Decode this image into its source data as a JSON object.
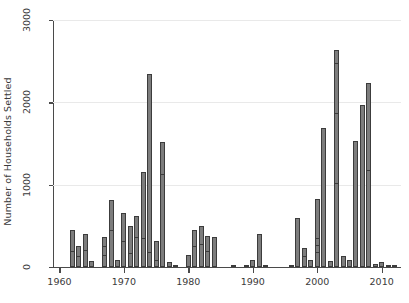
{
  "chart_data": {
    "type": "bar",
    "title": "",
    "subtitle": "",
    "xlabel": "",
    "ylabel": "Number of Households Settled",
    "xlim": [
      1959,
      2013
    ],
    "ylim": [
      0,
      3000
    ],
    "grid": "horizontal gridlines at 1000, 2000, 3000",
    "legend": "none",
    "x_ticks": [
      1960,
      1970,
      1980,
      1990,
      2000,
      2010
    ],
    "y_ticks": [
      0,
      1000,
      2000,
      3000
    ],
    "bar_color": "#7d7d7d",
    "bar_edge_color": "#3c3c3c",
    "gridline_color": "#e9e9e9",
    "axis_color": "#4a4a4a",
    "note": "Bars are internally segmented by thin horizontal rules (stacked sub-groups).",
    "categories": [
      1962,
      1963,
      1964,
      1965,
      1967,
      1968,
      1969,
      1970,
      1971,
      1972,
      1973,
      1974,
      1975,
      1976,
      1977,
      1978,
      1980,
      1981,
      1982,
      1983,
      1984,
      1987,
      1989,
      1990,
      1991,
      1992,
      1996,
      1997,
      1998,
      1999,
      2000,
      2001,
      2002,
      2003,
      2004,
      2005,
      2006,
      2007,
      2008,
      2009,
      2010,
      2011,
      2012
    ],
    "values": [
      450,
      250,
      400,
      70,
      360,
      820,
      80,
      650,
      500,
      620,
      1160,
      2350,
      320,
      1520,
      60,
      30,
      150,
      450,
      500,
      380,
      360,
      30,
      10,
      90,
      400,
      20,
      30,
      600,
      230,
      80,
      830,
      1690,
      70,
      2640,
      130,
      90,
      1530,
      1970,
      2230,
      40,
      55,
      25,
      15
    ],
    "series": [
      {
        "name": "Households settled per year",
        "values": [
          450,
          250,
          400,
          70,
          360,
          820,
          80,
          650,
          500,
          620,
          1160,
          2350,
          320,
          1520,
          60,
          30,
          150,
          450,
          500,
          380,
          360,
          30,
          10,
          90,
          400,
          20,
          30,
          600,
          230,
          80,
          830,
          1690,
          70,
          2640,
          130,
          90,
          1530,
          1970,
          2230,
          40,
          55,
          25,
          15
        ]
      }
    ],
    "bars": [
      {
        "year": 1962,
        "value": 450,
        "segments": [
          170,
          450
        ]
      },
      {
        "year": 1963,
        "value": 250,
        "segments": [
          110,
          250
        ]
      },
      {
        "year": 1964,
        "value": 400,
        "segments": [
          180,
          400
        ]
      },
      {
        "year": 1965,
        "value": 70,
        "segments": [
          70
        ]
      },
      {
        "year": 1967,
        "value": 360,
        "segments": [
          120,
          225,
          360
        ]
      },
      {
        "year": 1968,
        "value": 820,
        "segments": [
          430,
          820
        ]
      },
      {
        "year": 1969,
        "value": 80,
        "segments": [
          80
        ]
      },
      {
        "year": 1970,
        "value": 650,
        "segments": [
          290,
          650
        ]
      },
      {
        "year": 1971,
        "value": 500,
        "segments": [
          150,
          500
        ]
      },
      {
        "year": 1972,
        "value": 620,
        "segments": [
          345,
          620
        ]
      },
      {
        "year": 1973,
        "value": 1160,
        "segments": [
          330,
          1160
        ]
      },
      {
        "year": 1974,
        "value": 2350,
        "segments": [
          155,
          2350
        ]
      },
      {
        "year": 1975,
        "value": 320,
        "segments": [
          60,
          320
        ]
      },
      {
        "year": 1976,
        "value": 1520,
        "segments": [
          1110,
          1520
        ]
      },
      {
        "year": 1977,
        "value": 60,
        "segments": [
          60
        ]
      },
      {
        "year": 1978,
        "value": 30,
        "segments": [
          30
        ]
      },
      {
        "year": 1980,
        "value": 150,
        "segments": [
          150
        ]
      },
      {
        "year": 1981,
        "value": 450,
        "segments": [
          230,
          450
        ]
      },
      {
        "year": 1982,
        "value": 500,
        "segments": [
          250,
          500
        ]
      },
      {
        "year": 1983,
        "value": 380,
        "segments": [
          170,
          380
        ]
      },
      {
        "year": 1984,
        "value": 360,
        "segments": [
          360
        ]
      },
      {
        "year": 1987,
        "value": 30,
        "segments": [
          30
        ]
      },
      {
        "year": 1989,
        "value": 10,
        "segments": [
          10
        ]
      },
      {
        "year": 1990,
        "value": 90,
        "segments": [
          90
        ]
      },
      {
        "year": 1991,
        "value": 400,
        "segments": [
          400
        ]
      },
      {
        "year": 1992,
        "value": 20,
        "segments": [
          20
        ]
      },
      {
        "year": 1996,
        "value": 30,
        "segments": [
          30
        ]
      },
      {
        "year": 1997,
        "value": 600,
        "segments": [
          600
        ]
      },
      {
        "year": 1998,
        "value": 230,
        "segments": [
          110,
          230
        ]
      },
      {
        "year": 1999,
        "value": 80,
        "segments": [
          80
        ]
      },
      {
        "year": 2000,
        "value": 830,
        "segments": [
          160,
          240,
          330,
          830
        ]
      },
      {
        "year": 2001,
        "value": 1690,
        "segments": [
          1690
        ]
      },
      {
        "year": 2002,
        "value": 70,
        "segments": [
          70
        ]
      },
      {
        "year": 2003,
        "value": 2640,
        "segments": [
          1000,
          1850,
          2450,
          2640
        ]
      },
      {
        "year": 2004,
        "value": 130,
        "segments": [
          130
        ]
      },
      {
        "year": 2005,
        "value": 90,
        "segments": [
          90
        ]
      },
      {
        "year": 2006,
        "value": 1530,
        "segments": [
          1530
        ]
      },
      {
        "year": 2007,
        "value": 1970,
        "segments": [
          1970
        ]
      },
      {
        "year": 2008,
        "value": 2230,
        "segments": [
          1150,
          2230
        ]
      },
      {
        "year": 2009,
        "value": 40,
        "segments": [
          40
        ]
      },
      {
        "year": 2010,
        "value": 55,
        "segments": [
          55
        ]
      },
      {
        "year": 2011,
        "value": 25,
        "segments": [
          25
        ]
      },
      {
        "year": 2012,
        "value": 15,
        "segments": [
          15
        ]
      }
    ]
  },
  "axes": {
    "y_title": "Number of Households Settled",
    "y_tick_labels": [
      "0",
      "1000",
      "2000",
      "3000"
    ],
    "x_tick_labels": [
      "1960",
      "1970",
      "1980",
      "1990",
      "2000",
      "2010"
    ]
  }
}
